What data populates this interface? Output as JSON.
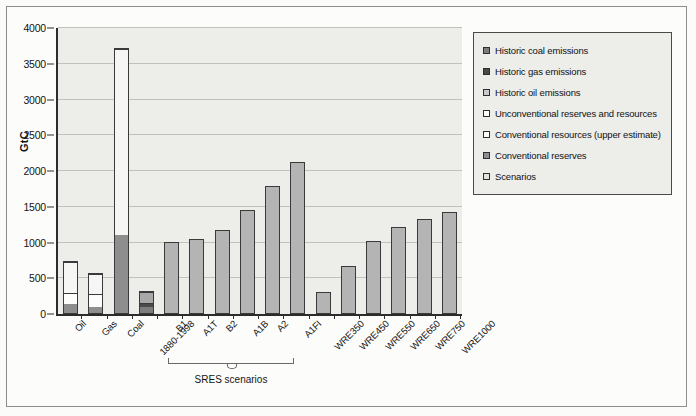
{
  "chart_data": {
    "type": "bar",
    "title": "",
    "xlabel": "",
    "ylabel": "GtC",
    "ylim": [
      0,
      4000
    ],
    "yticks": [
      0,
      500,
      1000,
      1500,
      2000,
      2500,
      3000,
      3500,
      4000
    ],
    "grid": true,
    "legend_position": "right",
    "categories": [
      "Oil",
      "Gas",
      "Coal",
      "1880-1998",
      "B1",
      "A1T",
      "B2",
      "A1B",
      "A2",
      "A1FI",
      "WRE350",
      "WRE450",
      "WRE550",
      "WRE650",
      "WRE750",
      "WRE1000"
    ],
    "annotations": [
      {
        "text": "SRES scenarios",
        "covers": [
          "B1",
          "A1T",
          "B2",
          "A1B",
          "A2",
          "A1FI"
        ]
      }
    ],
    "series": [
      {
        "name": "Historic coal emissions",
        "color": "#7d7d7d",
        "values": [
          null,
          null,
          null,
          90,
          null,
          null,
          null,
          null,
          null,
          null,
          null,
          null,
          null,
          null,
          null,
          null
        ]
      },
      {
        "name": "Historic gas emissions",
        "color": "#4a4a4a",
        "values": [
          null,
          null,
          null,
          45,
          null,
          null,
          null,
          null,
          null,
          null,
          null,
          null,
          null,
          null,
          null,
          null
        ]
      },
      {
        "name": "Historic oil emissions",
        "color": "#a8a8a8",
        "values": [
          null,
          null,
          null,
          155,
          null,
          null,
          null,
          null,
          null,
          null,
          null,
          null,
          null,
          null,
          null,
          null
        ]
      },
      {
        "name": "Unconventional reserves and resources",
        "color": "#f6f6f4",
        "values": [
          430,
          290,
          2600,
          null,
          null,
          null,
          null,
          null,
          null,
          null,
          null,
          null,
          null,
          null,
          null,
          null
        ]
      },
      {
        "name": "Conventional resources (upper estimate)",
        "color": "#fdfdfb",
        "values": [
          155,
          175,
          null,
          null,
          null,
          null,
          null,
          null,
          null,
          null,
          null,
          null,
          null,
          null,
          null,
          null
        ]
      },
      {
        "name": "Conventional reserves",
        "color": "#8e8e8e",
        "values": [
          125,
          85,
          1090,
          null,
          null,
          null,
          null,
          null,
          null,
          null,
          null,
          null,
          null,
          null,
          null,
          null
        ]
      },
      {
        "name": "Scenarios",
        "color": "#b4b4b4",
        "values": [
          null,
          null,
          null,
          null,
          980,
          1020,
          1150,
          1420,
          1765,
          2095,
          275,
          645,
          990,
          1185,
          1300,
          1400
        ]
      }
    ],
    "bar_totals": [
      710,
      550,
      3690,
      290,
      980,
      1020,
      1150,
      1420,
      1765,
      2095,
      275,
      645,
      990,
      1185,
      1300,
      1400
    ]
  },
  "legend": {
    "items": [
      {
        "label": "Historic coal emissions",
        "swatch": "#7d7d7d"
      },
      {
        "label": "Historic gas emissions",
        "swatch": "#4a4a4a"
      },
      {
        "label": "Historic oil emissions",
        "swatch": "#c9c9c9"
      },
      {
        "label": "Unconventional reserves and resources",
        "swatch": "#fdfdfb"
      },
      {
        "label": "Conventional resources (upper estimate)",
        "swatch": "#fdfdfb"
      },
      {
        "label": "Conventional reserves",
        "swatch": "#8e8e8e"
      },
      {
        "label": "Scenarios",
        "swatch": "#e2e2e0"
      }
    ]
  }
}
